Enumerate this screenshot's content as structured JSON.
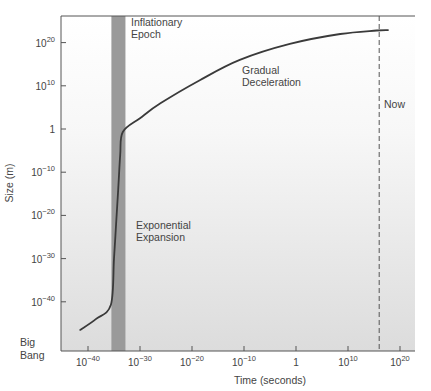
{
  "chart_data": {
    "type": "line",
    "title": "",
    "xlabel": "Time (seconds)",
    "ylabel": "Size (m)",
    "x_scale": "log",
    "y_scale": "log",
    "x_ticks": [
      {
        "exp": -40,
        "label": "10",
        "sup": "-40"
      },
      {
        "exp": -30,
        "label": "10",
        "sup": "-30"
      },
      {
        "exp": -20,
        "label": "10",
        "sup": "-20"
      },
      {
        "exp": -10,
        "label": "10",
        "sup": "-10"
      },
      {
        "exp": 0,
        "label": "1",
        "sup": ""
      },
      {
        "exp": 10,
        "label": "10",
        "sup": "10"
      },
      {
        "exp": 20,
        "label": "10",
        "sup": "20"
      }
    ],
    "y_ticks": [
      {
        "exp": 20,
        "label": "10",
        "sup": "20"
      },
      {
        "exp": 10,
        "label": "10",
        "sup": "10"
      },
      {
        "exp": 0,
        "label": "1",
        "sup": ""
      },
      {
        "exp": -10,
        "label": "10",
        "sup": "-10"
      },
      {
        "exp": -20,
        "label": "10",
        "sup": "-20"
      },
      {
        "exp": -30,
        "label": "10",
        "sup": "-30"
      },
      {
        "exp": -40,
        "label": "10",
        "sup": "-40"
      }
    ],
    "origin_label": [
      "Big",
      "Bang"
    ],
    "xlim_log10": [
      -46,
      23
    ],
    "ylim_log10": [
      -51,
      26
    ],
    "grid": false,
    "series": [
      {
        "name": "Size of the universe",
        "log10_time": [
          -41.5,
          -38.5,
          -35.6,
          -35.0,
          -34.6,
          -34.2,
          -33.8,
          -33.3,
          -30,
          -26,
          -18.5,
          -10.8,
          -1.2,
          8.5,
          15.5,
          17.7
        ],
        "log10_size": [
          -46.5,
          -44.0,
          -40.7,
          -30,
          -22,
          -14,
          -6,
          -0.7,
          2.5,
          6,
          11.3,
          16,
          19.7,
          22,
          22.8,
          22.9
        ]
      }
    ],
    "bands": [
      {
        "name": "Inflationary Epoch",
        "log10_time_range": [
          -35.5,
          -32.8
        ],
        "color": "#9a9a9a"
      }
    ],
    "vlines": [
      {
        "name": "Now",
        "log10_time": 16,
        "style": "dashed"
      }
    ],
    "annotations": [
      {
        "lines": [
          "Inflationary",
          "Epoch"
        ],
        "x": 131,
        "y": 26
      },
      {
        "lines": [
          "Gradual",
          "Deceleration"
        ],
        "x": 242,
        "y": 74
      },
      {
        "lines": [
          "Exponential",
          "Expansion"
        ],
        "x": 136,
        "y": 229
      },
      {
        "lines": [
          "Now"
        ],
        "x": 384,
        "y": 108
      }
    ]
  },
  "colors": {
    "curve": "#3a3a3a",
    "band": "#9a9a9a",
    "axis": "#555555",
    "bg_top": "#ffffff",
    "bg_bottom": "#dedede"
  }
}
